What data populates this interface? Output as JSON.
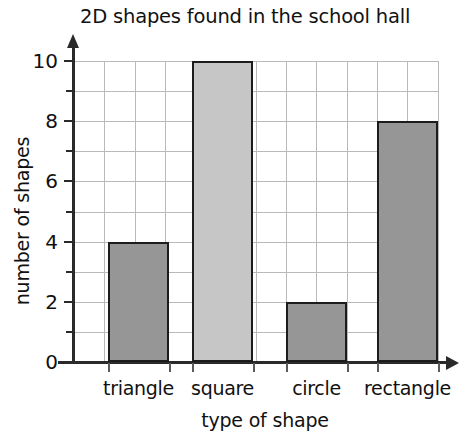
{
  "chart_data": {
    "type": "bar",
    "title": "2D shapes found in the school hall",
    "xlabel": "type of shape",
    "ylabel": "number of shapes",
    "categories": [
      "triangle",
      "square",
      "circle",
      "rectangle"
    ],
    "values": [
      4,
      10,
      2,
      8
    ],
    "ylim": [
      0,
      10
    ],
    "y_tick_labels": [
      "0",
      "2",
      "4",
      "6",
      "8",
      "10"
    ],
    "y_tick_values": [
      0,
      2,
      4,
      6,
      8,
      10
    ],
    "y_minor_tick_values": [
      1,
      3,
      5,
      7,
      9
    ],
    "grid": true,
    "legend": "none",
    "bar_colors": [
      "#969696",
      "#c6c6c6",
      "#969696",
      "#969696"
    ],
    "bar_edge_color": "#1c1c1c",
    "grid_color": "#b9b9b9",
    "axis_color": "#2a2a2a"
  }
}
